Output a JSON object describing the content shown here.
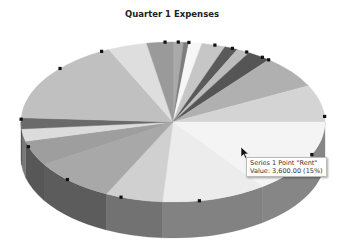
{
  "chart_data": {
    "type": "pie",
    "title": "Quarter 1 Expenses",
    "style": "3d-grayscale",
    "series": [
      {
        "name": "Series 1",
        "points": [
          {
            "label": "Rent",
            "value": 3600.0,
            "percent": 15,
            "color": "#f4f4f4"
          }
        ]
      }
    ],
    "slices_visual": [
      {
        "start": -90,
        "sweep": 4,
        "color": "#a9a9a9"
      },
      {
        "start": -86,
        "sweep": 2,
        "color": "#7d7d7d"
      },
      {
        "start": -84,
        "sweep": 5,
        "color": "#f6f6f6"
      },
      {
        "start": -79,
        "sweep": 9,
        "color": "#c6c6c6"
      },
      {
        "start": -70,
        "sweep": 5,
        "color": "#5a5a5a"
      },
      {
        "start": -65,
        "sweep": 5,
        "color": "#bdbdbd"
      },
      {
        "start": -60,
        "sweep": 9,
        "color": "#555555"
      },
      {
        "start": -51,
        "sweep": 24,
        "color": "#b0b0b0"
      },
      {
        "start": -27,
        "sweep": 27,
        "color": "#d4d4d4"
      },
      {
        "start": 0,
        "sweep": 54,
        "color": "#f4f4f4"
      },
      {
        "start": 54,
        "sweep": 40,
        "color": "#ececec"
      },
      {
        "start": 94,
        "sweep": 22,
        "color": "#d0d0d0"
      },
      {
        "start": 116,
        "sweep": 32,
        "color": "#a8a8a8"
      },
      {
        "start": 148,
        "sweep": 18,
        "color": "#9e9e9e"
      },
      {
        "start": 166,
        "sweep": 9,
        "color": "#dcdcdc"
      },
      {
        "start": 175,
        "sweep": 8,
        "color": "#6a6a6a"
      },
      {
        "start": 183,
        "sweep": 62,
        "color": "#c0c0c0"
      },
      {
        "start": 245,
        "sweep": 15,
        "color": "#dedede"
      },
      {
        "start": 260,
        "sweep": 10,
        "color": "#9a9a9a"
      }
    ]
  },
  "tooltip": {
    "line1": "Series 1 Point \"Rent\"",
    "line2": "Value: 3,600.00 (15%)"
  },
  "selection_handles": true
}
